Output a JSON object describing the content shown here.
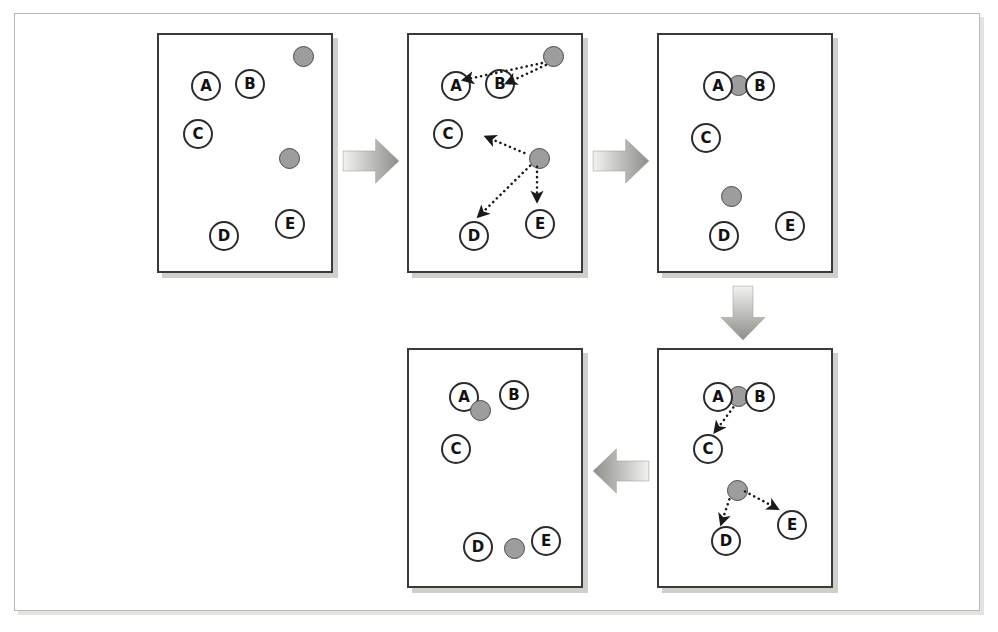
{
  "figure": {
    "node_labels": [
      "A",
      "B",
      "C",
      "D",
      "E"
    ],
    "colors": {
      "token_fill": "#9d9d9d",
      "token_stroke": "#4a4a4a",
      "node_fill": "#ffffff",
      "node_stroke": "#2b2b2b",
      "panel_stroke": "#3a3a3a",
      "frame_stroke": "#b9b9b6",
      "connector_light": "#f2f2f0",
      "connector_dark": "#8d8d89",
      "arrow_ink": "#1a1a1a",
      "background": "#ffffff"
    }
  },
  "panels": [
    {
      "id": "panel-1",
      "step": "1",
      "x": 157,
      "y": 33,
      "w": 176,
      "h": 240,
      "nodes": [
        {
          "label": "A",
          "x": 32,
          "y": 36
        },
        {
          "label": "B",
          "x": 76,
          "y": 34
        },
        {
          "label": "C",
          "x": 24,
          "y": 84
        },
        {
          "label": "D",
          "x": 50,
          "y": 186
        },
        {
          "label": "E",
          "x": 116,
          "y": 174
        },
        {
          "label": "A",
          "x": 0,
          "y": 0
        }
      ],
      "tokens": [
        {
          "x": 134,
          "y": 11
        },
        {
          "x": 120,
          "y": 113
        }
      ],
      "arrows": []
    },
    {
      "id": "panel-2",
      "step": "2",
      "x": 407,
      "y": 33,
      "w": 176,
      "h": 240,
      "nodes": [
        {
          "label": "A",
          "x": 32,
          "y": 36
        },
        {
          "label": "B",
          "x": 76,
          "y": 34
        },
        {
          "label": "C",
          "x": 24,
          "y": 84
        },
        {
          "label": "D",
          "x": 50,
          "y": 186
        },
        {
          "label": "E",
          "x": 116,
          "y": 174
        }
      ],
      "tokens": [
        {
          "x": 134,
          "y": 11
        },
        {
          "x": 120,
          "y": 113
        }
      ],
      "arrows": [
        {
          "from": "token-1",
          "to": "A",
          "x1": 136,
          "y1": 28,
          "x2": 57,
          "y2": 45
        },
        {
          "from": "token-1",
          "to": "B",
          "x1": 140,
          "y1": 30,
          "x2": 101,
          "y2": 48
        },
        {
          "from": "token-2",
          "to": "C",
          "x1": 118,
          "y1": 120,
          "x2": 80,
          "y2": 104
        },
        {
          "from": "token-2",
          "to": "D",
          "x1": 124,
          "y1": 133,
          "x2": 72,
          "y2": 184
        },
        {
          "from": "token-2",
          "to": "E",
          "x1": 131,
          "y1": 134,
          "x2": 131,
          "y2": 168
        }
      ]
    },
    {
      "id": "panel-3",
      "step": "3",
      "x": 657,
      "y": 33,
      "w": 176,
      "h": 240,
      "nodes": [
        {
          "label": "A",
          "x": 44,
          "y": 36
        },
        {
          "label": "B",
          "x": 86,
          "y": 36
        },
        {
          "label": "C",
          "x": 32,
          "y": 88
        },
        {
          "label": "D",
          "x": 50,
          "y": 186
        },
        {
          "label": "E",
          "x": 116,
          "y": 176
        }
      ],
      "tokens": [
        {
          "x": 69,
          "y": 40
        },
        {
          "x": 62,
          "y": 151
        }
      ],
      "arrows": []
    },
    {
      "id": "panel-4",
      "step": "4",
      "x": 657,
      "y": 348,
      "w": 176,
      "h": 240,
      "nodes": [
        {
          "label": "A",
          "x": 44,
          "y": 32
        },
        {
          "label": "B",
          "x": 86,
          "y": 32
        },
        {
          "label": "C",
          "x": 34,
          "y": 84
        },
        {
          "label": "D",
          "x": 52,
          "y": 176
        },
        {
          "label": "E",
          "x": 118,
          "y": 160
        }
      ],
      "tokens": [
        {
          "x": 69,
          "y": 36
        },
        {
          "x": 68,
          "y": 130
        }
      ],
      "arrows": [
        {
          "from": "token-1",
          "to": "C",
          "x1": 76,
          "y1": 58,
          "x2": 58,
          "y2": 82
        },
        {
          "from": "token-2",
          "to": "D",
          "x1": 72,
          "y1": 152,
          "x2": 64,
          "y2": 176
        },
        {
          "from": "token-2",
          "to": "E",
          "x1": 88,
          "y1": 144,
          "x2": 120,
          "y2": 161
        }
      ]
    },
    {
      "id": "panel-5",
      "step": "5",
      "x": 407,
      "y": 348,
      "w": 176,
      "h": 240,
      "nodes": [
        {
          "label": "A",
          "x": 40,
          "y": 32
        },
        {
          "label": "B",
          "x": 90,
          "y": 30
        },
        {
          "label": "C",
          "x": 32,
          "y": 84
        },
        {
          "label": "D",
          "x": 54,
          "y": 182
        },
        {
          "label": "E",
          "x": 122,
          "y": 176
        }
      ],
      "tokens": [
        {
          "x": 61,
          "y": 50
        },
        {
          "x": 95,
          "y": 188
        }
      ],
      "arrows": []
    }
  ],
  "connectors": [
    {
      "id": "connector-1",
      "direction": "right",
      "x": 342,
      "y": 136,
      "w": 58,
      "h": 50
    },
    {
      "id": "connector-2",
      "direction": "right",
      "x": 592,
      "y": 136,
      "w": 58,
      "h": 50
    },
    {
      "id": "connector-3",
      "direction": "down",
      "x": 718,
      "y": 285,
      "w": 50,
      "h": 56
    },
    {
      "id": "connector-4",
      "direction": "left",
      "x": 592,
      "y": 446,
      "w": 58,
      "h": 50
    }
  ]
}
